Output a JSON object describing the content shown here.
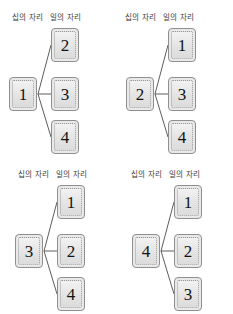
{
  "headers": {
    "tens_place": "십의 자리",
    "ones_place": "일의 자리"
  },
  "colors": {
    "card_fill": "#e9e9e9",
    "card_border": "#8f8f8f",
    "digit": "#121212",
    "connector": "#4a4a4a",
    "header_text": "#3a3a3a",
    "background": "#ffffff"
  },
  "diagrams": [
    {
      "id": "diagram-tens-1",
      "tens_digit": "1",
      "ones_digits": [
        "2",
        "3",
        "4"
      ]
    },
    {
      "id": "diagram-tens-2",
      "tens_digit": "2",
      "ones_digits": [
        "1",
        "3",
        "4"
      ]
    },
    {
      "id": "diagram-tens-3",
      "tens_digit": "3",
      "ones_digits": [
        "1",
        "2",
        "4"
      ]
    },
    {
      "id": "diagram-tens-4",
      "tens_digit": "4",
      "ones_digits": [
        "1",
        "2",
        "3"
      ]
    }
  ]
}
